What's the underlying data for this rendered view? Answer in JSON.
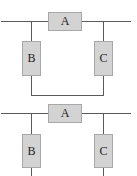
{
  "diagrams": [
    {
      "name": "circuit-top",
      "components": {
        "a": "A",
        "b": "B",
        "c": "C"
      },
      "description": "A in series on main line; B and C branches joined at bottom"
    },
    {
      "name": "circuit-bottom",
      "components": {
        "a": "A",
        "b": "B",
        "c": "C"
      },
      "description": "A in series on main line; B and C branches open at bottom"
    }
  ],
  "colors": {
    "wire": "#5a5a5a",
    "box_fill": "#d3d3d3",
    "box_border": "#a8a8a8"
  }
}
